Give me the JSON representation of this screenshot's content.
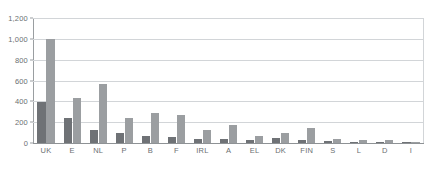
{
  "chart_data": {
    "type": "bar",
    "title": "",
    "subtitle": "",
    "xlabel": "",
    "ylabel": "",
    "ylim": [
      0,
      1200
    ],
    "yticks": [
      "0",
      "200",
      "400",
      "600",
      "800",
      "1,000",
      "1,200"
    ],
    "ytick_values": [
      0,
      200,
      400,
      600,
      800,
      1000,
      1200
    ],
    "grid": true,
    "legend": false,
    "legend_position": "none",
    "categories": [
      "UK",
      "E",
      "NL",
      "P",
      "B",
      "F",
      "IRL",
      "A",
      "EL",
      "DK",
      "FIN",
      "S",
      "L",
      "D",
      "I"
    ],
    "series": [
      {
        "name": "series-a",
        "color": "#6f7276",
        "values": [
          394,
          240,
          125,
          96,
          67,
          58,
          42,
          38,
          29,
          48,
          29,
          19,
          10,
          14,
          10
        ]
      },
      {
        "name": "series-b",
        "color": "#9b9ea1",
        "values": [
          1000,
          432,
          566,
          240,
          288,
          269,
          125,
          173,
          67,
          96,
          144,
          38,
          29,
          29,
          14
        ]
      }
    ],
    "annotations": []
  },
  "colors": {
    "background": "#ffffff",
    "gridline": "#d2d5d8",
    "axis": "#9a9ea1",
    "tick_text": "#6b6f72",
    "series_a": "#6f7276",
    "series_b": "#9b9ea1"
  }
}
